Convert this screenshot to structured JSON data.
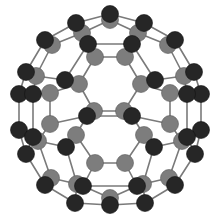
{
  "figure": {
    "colors": {
      "background": "#ffffff",
      "bond": "#7a7a7a",
      "atom_front": "#262626",
      "atom_back": "#7d7d7d"
    },
    "atom_radius": 8.5,
    "atoms": [
      {
        "id": "a1",
        "x": 110,
        "y": 20,
        "layer": "back"
      },
      {
        "id": "a2",
        "x": 110,
        "y": 14,
        "layer": "front"
      },
      {
        "id": "a3",
        "x": 82,
        "y": 33,
        "layer": "back"
      },
      {
        "id": "a4",
        "x": 76,
        "y": 23,
        "layer": "front"
      },
      {
        "id": "a5",
        "x": 138,
        "y": 33,
        "layer": "back"
      },
      {
        "id": "a6",
        "x": 144,
        "y": 23,
        "layer": "front"
      },
      {
        "id": "a7",
        "x": 88,
        "y": 44,
        "layer": "front"
      },
      {
        "id": "a8",
        "x": 132,
        "y": 44,
        "layer": "front"
      },
      {
        "id": "a9",
        "x": 95,
        "y": 57,
        "layer": "back"
      },
      {
        "id": "a10",
        "x": 125,
        "y": 57,
        "layer": "back"
      },
      {
        "id": "a11",
        "x": 52,
        "y": 45,
        "layer": "back"
      },
      {
        "id": "a12",
        "x": 45,
        "y": 40,
        "layer": "front"
      },
      {
        "id": "a13",
        "x": 168,
        "y": 45,
        "layer": "back"
      },
      {
        "id": "a14",
        "x": 175,
        "y": 40,
        "layer": "front"
      },
      {
        "id": "a15",
        "x": 36,
        "y": 76,
        "layer": "back"
      },
      {
        "id": "a16",
        "x": 26,
        "y": 72,
        "layer": "front"
      },
      {
        "id": "a17",
        "x": 184,
        "y": 76,
        "layer": "back"
      },
      {
        "id": "a18",
        "x": 194,
        "y": 72,
        "layer": "front"
      },
      {
        "id": "a19",
        "x": 65,
        "y": 80,
        "layer": "front"
      },
      {
        "id": "a20",
        "x": 155,
        "y": 80,
        "layer": "front"
      },
      {
        "id": "a21",
        "x": 79,
        "y": 84,
        "layer": "back"
      },
      {
        "id": "a22",
        "x": 141,
        "y": 84,
        "layer": "back"
      },
      {
        "id": "a23",
        "x": 19,
        "y": 94,
        "layer": "front"
      },
      {
        "id": "a24",
        "x": 33,
        "y": 94,
        "layer": "front"
      },
      {
        "id": "a25",
        "x": 50,
        "y": 93,
        "layer": "back"
      },
      {
        "id": "a26",
        "x": 201,
        "y": 94,
        "layer": "front"
      },
      {
        "id": "a27",
        "x": 187,
        "y": 94,
        "layer": "front"
      },
      {
        "id": "a28",
        "x": 170,
        "y": 93,
        "layer": "back"
      },
      {
        "id": "a29",
        "x": 94,
        "y": 111,
        "layer": "back"
      },
      {
        "id": "a30",
        "x": 124,
        "y": 111,
        "layer": "back"
      },
      {
        "id": "a31",
        "x": 87,
        "y": 116,
        "layer": "front"
      },
      {
        "id": "a32",
        "x": 132,
        "y": 116,
        "layer": "front"
      },
      {
        "id": "a33",
        "x": 50,
        "y": 124,
        "layer": "back"
      },
      {
        "id": "a34",
        "x": 170,
        "y": 124,
        "layer": "back"
      },
      {
        "id": "a35",
        "x": 19,
        "y": 130,
        "layer": "front"
      },
      {
        "id": "a36",
        "x": 201,
        "y": 130,
        "layer": "front"
      },
      {
        "id": "a37",
        "x": 38,
        "y": 141,
        "layer": "back"
      },
      {
        "id": "a38",
        "x": 33,
        "y": 137,
        "layer": "front"
      },
      {
        "id": "a39",
        "x": 182,
        "y": 141,
        "layer": "back"
      },
      {
        "id": "a40",
        "x": 187,
        "y": 137,
        "layer": "front"
      },
      {
        "id": "a41",
        "x": 76,
        "y": 135,
        "layer": "back"
      },
      {
        "id": "a42",
        "x": 144,
        "y": 135,
        "layer": "back"
      },
      {
        "id": "a43",
        "x": 66,
        "y": 147,
        "layer": "front"
      },
      {
        "id": "a44",
        "x": 154,
        "y": 147,
        "layer": "front"
      },
      {
        "id": "a45",
        "x": 26,
        "y": 154,
        "layer": "front"
      },
      {
        "id": "a46",
        "x": 195,
        "y": 154,
        "layer": "front"
      },
      {
        "id": "a47",
        "x": 95,
        "y": 163,
        "layer": "back"
      },
      {
        "id": "a48",
        "x": 125,
        "y": 163,
        "layer": "back"
      },
      {
        "id": "a49",
        "x": 51,
        "y": 178,
        "layer": "back"
      },
      {
        "id": "a50",
        "x": 45,
        "y": 185,
        "layer": "front"
      },
      {
        "id": "a51",
        "x": 169,
        "y": 178,
        "layer": "back"
      },
      {
        "id": "a52",
        "x": 175,
        "y": 185,
        "layer": "front"
      },
      {
        "id": "a53",
        "x": 77,
        "y": 184,
        "layer": "back"
      },
      {
        "id": "a54",
        "x": 83,
        "y": 186,
        "layer": "front"
      },
      {
        "id": "a55",
        "x": 143,
        "y": 184,
        "layer": "back"
      },
      {
        "id": "a56",
        "x": 137,
        "y": 186,
        "layer": "front"
      },
      {
        "id": "a57",
        "x": 110,
        "y": 198,
        "layer": "back"
      },
      {
        "id": "a58",
        "x": 110,
        "y": 205,
        "layer": "front"
      },
      {
        "id": "a59",
        "x": 75,
        "y": 203,
        "layer": "front"
      },
      {
        "id": "a60",
        "x": 145,
        "y": 203,
        "layer": "front"
      }
    ],
    "bonds": [
      [
        "a2",
        "a4"
      ],
      [
        "a2",
        "a6"
      ],
      [
        "a1",
        "a3"
      ],
      [
        "a1",
        "a5"
      ],
      [
        "a2",
        "a1"
      ],
      [
        "a4",
        "a12"
      ],
      [
        "a6",
        "a14"
      ],
      [
        "a4",
        "a3"
      ],
      [
        "a6",
        "a5"
      ],
      [
        "a3",
        "a7"
      ],
      [
        "a5",
        "a8"
      ],
      [
        "a7",
        "a8"
      ],
      [
        "a7",
        "a9"
      ],
      [
        "a8",
        "a10"
      ],
      [
        "a9",
        "a10"
      ],
      [
        "a3",
        "a11"
      ],
      [
        "a5",
        "a13"
      ],
      [
        "a12",
        "a11"
      ],
      [
        "a14",
        "a13"
      ],
      [
        "a12",
        "a16"
      ],
      [
        "a14",
        "a18"
      ],
      [
        "a11",
        "a15"
      ],
      [
        "a13",
        "a17"
      ],
      [
        "a7",
        "a19"
      ],
      [
        "a8",
        "a20"
      ],
      [
        "a19",
        "a15"
      ],
      [
        "a20",
        "a17"
      ],
      [
        "a9",
        "a21"
      ],
      [
        "a10",
        "a22"
      ],
      [
        "a19",
        "a21"
      ],
      [
        "a20",
        "a22"
      ],
      [
        "a16",
        "a23"
      ],
      [
        "a18",
        "a26"
      ],
      [
        "a15",
        "a24"
      ],
      [
        "a17",
        "a27"
      ],
      [
        "a24",
        "a25"
      ],
      [
        "a27",
        "a28"
      ],
      [
        "a21",
        "a25"
      ],
      [
        "a22",
        "a28"
      ],
      [
        "a23",
        "a24"
      ],
      [
        "a26",
        "a27"
      ],
      [
        "a21",
        "a29"
      ],
      [
        "a22",
        "a30"
      ],
      [
        "a29",
        "a30"
      ],
      [
        "a31",
        "a32"
      ],
      [
        "a29",
        "a31"
      ],
      [
        "a30",
        "a32"
      ],
      [
        "a23",
        "a35"
      ],
      [
        "a24",
        "a38"
      ],
      [
        "a25",
        "a33"
      ],
      [
        "a26",
        "a36"
      ],
      [
        "a27",
        "a40"
      ],
      [
        "a28",
        "a34"
      ],
      [
        "a31",
        "a33"
      ],
      [
        "a32",
        "a34"
      ],
      [
        "a31",
        "a41"
      ],
      [
        "a32",
        "a42"
      ],
      [
        "a35",
        "a38"
      ],
      [
        "a36",
        "a40"
      ],
      [
        "a38",
        "a37"
      ],
      [
        "a40",
        "a39"
      ],
      [
        "a33",
        "a37"
      ],
      [
        "a34",
        "a39"
      ],
      [
        "a41",
        "a43"
      ],
      [
        "a42",
        "a44"
      ],
      [
        "a37",
        "a43"
      ],
      [
        "a39",
        "a44"
      ],
      [
        "a35",
        "a45"
      ],
      [
        "a36",
        "a46"
      ],
      [
        "a38",
        "a45"
      ],
      [
        "a40",
        "a46"
      ],
      [
        "a41",
        "a47"
      ],
      [
        "a42",
        "a48"
      ],
      [
        "a47",
        "a48"
      ],
      [
        "a45",
        "a50"
      ],
      [
        "a46",
        "a52"
      ],
      [
        "a37",
        "a49"
      ],
      [
        "a39",
        "a51"
      ],
      [
        "a49",
        "a50"
      ],
      [
        "a51",
        "a52"
      ],
      [
        "a43",
        "a53"
      ],
      [
        "a44",
        "a55"
      ],
      [
        "a47",
        "a54"
      ],
      [
        "a48",
        "a56"
      ],
      [
        "a53",
        "a54"
      ],
      [
        "a55",
        "a56"
      ],
      [
        "a54",
        "a56"
      ],
      [
        "a49",
        "a53"
      ],
      [
        "a51",
        "a55"
      ],
      [
        "a50",
        "a59"
      ],
      [
        "a52",
        "a60"
      ],
      [
        "a59",
        "a58"
      ],
      [
        "a60",
        "a58"
      ],
      [
        "a53",
        "a59"
      ],
      [
        "a55",
        "a60"
      ],
      [
        "a57",
        "a58"
      ],
      [
        "a57",
        "a54"
      ],
      [
        "a57",
        "a56"
      ]
    ]
  }
}
